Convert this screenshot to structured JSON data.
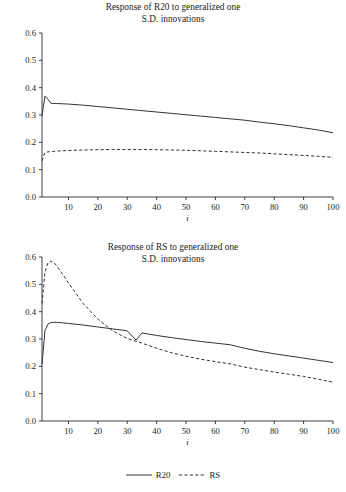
{
  "figure": {
    "background": "#ffffff",
    "line_color": "#333333",
    "axis_color": "#2b2b2b"
  },
  "legend": {
    "position": "bottom-center",
    "entries": [
      {
        "label": "R20",
        "style": "solid"
      },
      {
        "label": "RS",
        "style": "dashed"
      }
    ]
  },
  "footer": {
    "caption": ""
  },
  "chart_data": [
    {
      "type": "line",
      "title": "Response of R20 to generalized one S.D. innovations",
      "title_line1": "Response of R20 to generalized one",
      "title_line2": "S.D. innovations",
      "xlabel": "i",
      "ylabel": "",
      "xlim": [
        1,
        100
      ],
      "ylim": [
        0.0,
        0.6
      ],
      "grid": false,
      "xticks": [
        10,
        20,
        30,
        40,
        50,
        60,
        70,
        80,
        90,
        100
      ],
      "xticklabels": [
        "10",
        "20",
        "30",
        "40",
        "50",
        "60",
        "70",
        "80",
        "90",
        "100"
      ],
      "yticks": [
        0.0,
        0.1,
        0.2,
        0.3,
        0.4,
        0.5,
        0.6
      ],
      "yticklabels": [
        "0.0",
        "0.1",
        "0.2",
        "0.3",
        "0.4",
        "0.5",
        "0.6"
      ],
      "x": [
        1,
        2,
        3,
        4,
        5,
        6,
        8,
        10,
        15,
        20,
        25,
        30,
        35,
        40,
        45,
        50,
        55,
        60,
        65,
        70,
        75,
        80,
        85,
        90,
        95,
        100
      ],
      "series": [
        {
          "name": "R20",
          "style": "solid",
          "values": [
            0.297,
            0.369,
            0.358,
            0.343,
            0.342,
            0.342,
            0.341,
            0.34,
            0.336,
            0.331,
            0.326,
            0.321,
            0.316,
            0.311,
            0.306,
            0.301,
            0.296,
            0.291,
            0.286,
            0.281,
            0.274,
            0.268,
            0.261,
            0.253,
            0.245,
            0.235
          ]
        },
        {
          "name": "RS",
          "style": "dashed",
          "values": [
            0.132,
            0.163,
            0.165,
            0.166,
            0.167,
            0.168,
            0.169,
            0.17,
            0.172,
            0.173,
            0.174,
            0.174,
            0.174,
            0.173,
            0.172,
            0.171,
            0.169,
            0.167,
            0.165,
            0.163,
            0.161,
            0.158,
            0.155,
            0.152,
            0.149,
            0.145
          ]
        }
      ]
    },
    {
      "type": "line",
      "title": "Response of RS to generalized one S.D. innovations",
      "title_line1": "Response of RS to generalized one",
      "title_line2": "S.D. innovations",
      "xlabel": "i",
      "ylabel": "",
      "xlim": [
        1,
        100
      ],
      "ylim": [
        0.0,
        0.6
      ],
      "grid": false,
      "xticks": [
        10,
        20,
        30,
        40,
        50,
        60,
        70,
        80,
        90,
        100
      ],
      "xticklabels": [
        "10",
        "20",
        "30",
        "40",
        "50",
        "60",
        "70",
        "80",
        "90",
        "100"
      ],
      "yticks": [
        0.0,
        0.1,
        0.2,
        0.3,
        0.4,
        0.5,
        0.6
      ],
      "yticklabels": [
        "0.0",
        "0.1",
        "0.2",
        "0.3",
        "0.4",
        "0.5",
        "0.6"
      ],
      "x": [
        1,
        2,
        3,
        4,
        5,
        6,
        8,
        10,
        15,
        20,
        25,
        30,
        33,
        35,
        40,
        45,
        50,
        55,
        60,
        65,
        70,
        75,
        80,
        85,
        90,
        95,
        100
      ],
      "series": [
        {
          "name": "R20",
          "style": "solid",
          "values": [
            0.207,
            0.33,
            0.354,
            0.36,
            0.361,
            0.361,
            0.359,
            0.357,
            0.351,
            0.344,
            0.337,
            0.33,
            0.296,
            0.322,
            0.313,
            0.305,
            0.298,
            0.291,
            0.285,
            0.279,
            0.266,
            0.255,
            0.246,
            0.238,
            0.23,
            0.222,
            0.214
          ]
        },
        {
          "name": "RS",
          "style": "dashed",
          "values": [
            0.43,
            0.545,
            0.578,
            0.585,
            0.58,
            0.568,
            0.538,
            0.505,
            0.43,
            0.373,
            0.33,
            0.302,
            0.292,
            0.285,
            0.266,
            0.25,
            0.237,
            0.226,
            0.217,
            0.209,
            0.197,
            0.188,
            0.179,
            0.171,
            0.163,
            0.153,
            0.142
          ]
        }
      ]
    }
  ]
}
